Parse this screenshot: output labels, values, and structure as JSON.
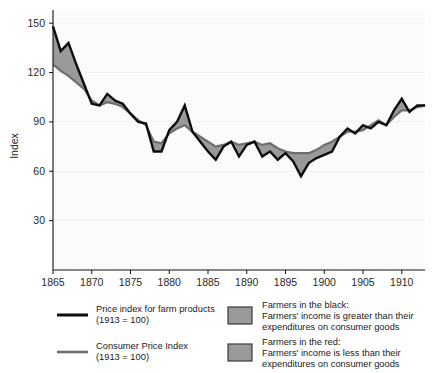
{
  "chart_data": {
    "type": "area",
    "title": "",
    "subtitle": "",
    "xlabel": "",
    "ylabel": "Index",
    "xlim": [
      1865,
      1913
    ],
    "ylim": [
      0,
      158
    ],
    "grid": true,
    "grid_axis": "y",
    "legend_position": "below",
    "x_ticks": [
      1865,
      1870,
      1875,
      1880,
      1885,
      1890,
      1895,
      1900,
      1905,
      1910
    ],
    "y_ticks": [
      30,
      60,
      90,
      120,
      150
    ],
    "x": [
      1865,
      1866,
      1867,
      1868,
      1869,
      1870,
      1871,
      1872,
      1873,
      1874,
      1875,
      1876,
      1877,
      1878,
      1879,
      1880,
      1881,
      1882,
      1883,
      1884,
      1885,
      1886,
      1887,
      1888,
      1889,
      1890,
      1891,
      1892,
      1893,
      1894,
      1895,
      1896,
      1897,
      1898,
      1899,
      1900,
      1901,
      1902,
      1903,
      1904,
      1905,
      1906,
      1907,
      1908,
      1909,
      1910,
      1911,
      1912,
      1913
    ],
    "series": [
      {
        "name": "Price index for farm products (1913 = 100)",
        "color": "#0d0d0d",
        "values": [
          148,
          133,
          138,
          125,
          113,
          101,
          100,
          107,
          103,
          101,
          95,
          90,
          89,
          72,
          72,
          85,
          90,
          100,
          84,
          78,
          72,
          67,
          75,
          78,
          69,
          76,
          78,
          69,
          72,
          67,
          71,
          66,
          57,
          65,
          68,
          70,
          72,
          81,
          86,
          83,
          88,
          86,
          90,
          88,
          97,
          104,
          96,
          100,
          100
        ]
      },
      {
        "name": "Consumer Price Index (1913 = 100)",
        "color": "#6e6e6e",
        "values": [
          125,
          121,
          118,
          114,
          110,
          103,
          100,
          102,
          101,
          99,
          95,
          91,
          88,
          78,
          77,
          83,
          86,
          88,
          84,
          81,
          78,
          75,
          76,
          78,
          76,
          77,
          78,
          76,
          77,
          74,
          72,
          71,
          71,
          71,
          73,
          76,
          78,
          81,
          84,
          84,
          85,
          88,
          91,
          88,
          93,
          97,
          97,
          99,
          100
        ]
      }
    ],
    "band": {
      "fill": "#9a9a9a",
      "description_above": "Farmers in the black",
      "description_below": "Farmers in the red"
    }
  },
  "legend": {
    "entries": [
      {
        "kind": "line",
        "style": "black-line",
        "line_color": "#0d0d0d",
        "label_line1": "Price index for farm products",
        "label_line2": "(1913 = 100)"
      },
      {
        "kind": "line",
        "style": "gray-line",
        "line_color": "#6e6e6e",
        "label_line1": "Consumer Price Index",
        "label_line2": "(1913 = 100)"
      },
      {
        "kind": "swatch",
        "swatch_color": "#9a9a9a",
        "label_line1": "Farmers in the black:",
        "label_line2": "Farmers' income is greater than their",
        "label_line3": "expenditures on consumer goods"
      },
      {
        "kind": "swatch",
        "swatch_color": "#9a9a9a",
        "label_line1": "Farmers in the red:",
        "label_line2": "Farmers' income is less than their",
        "label_line3": "expenditures on consumer goods"
      }
    ]
  }
}
